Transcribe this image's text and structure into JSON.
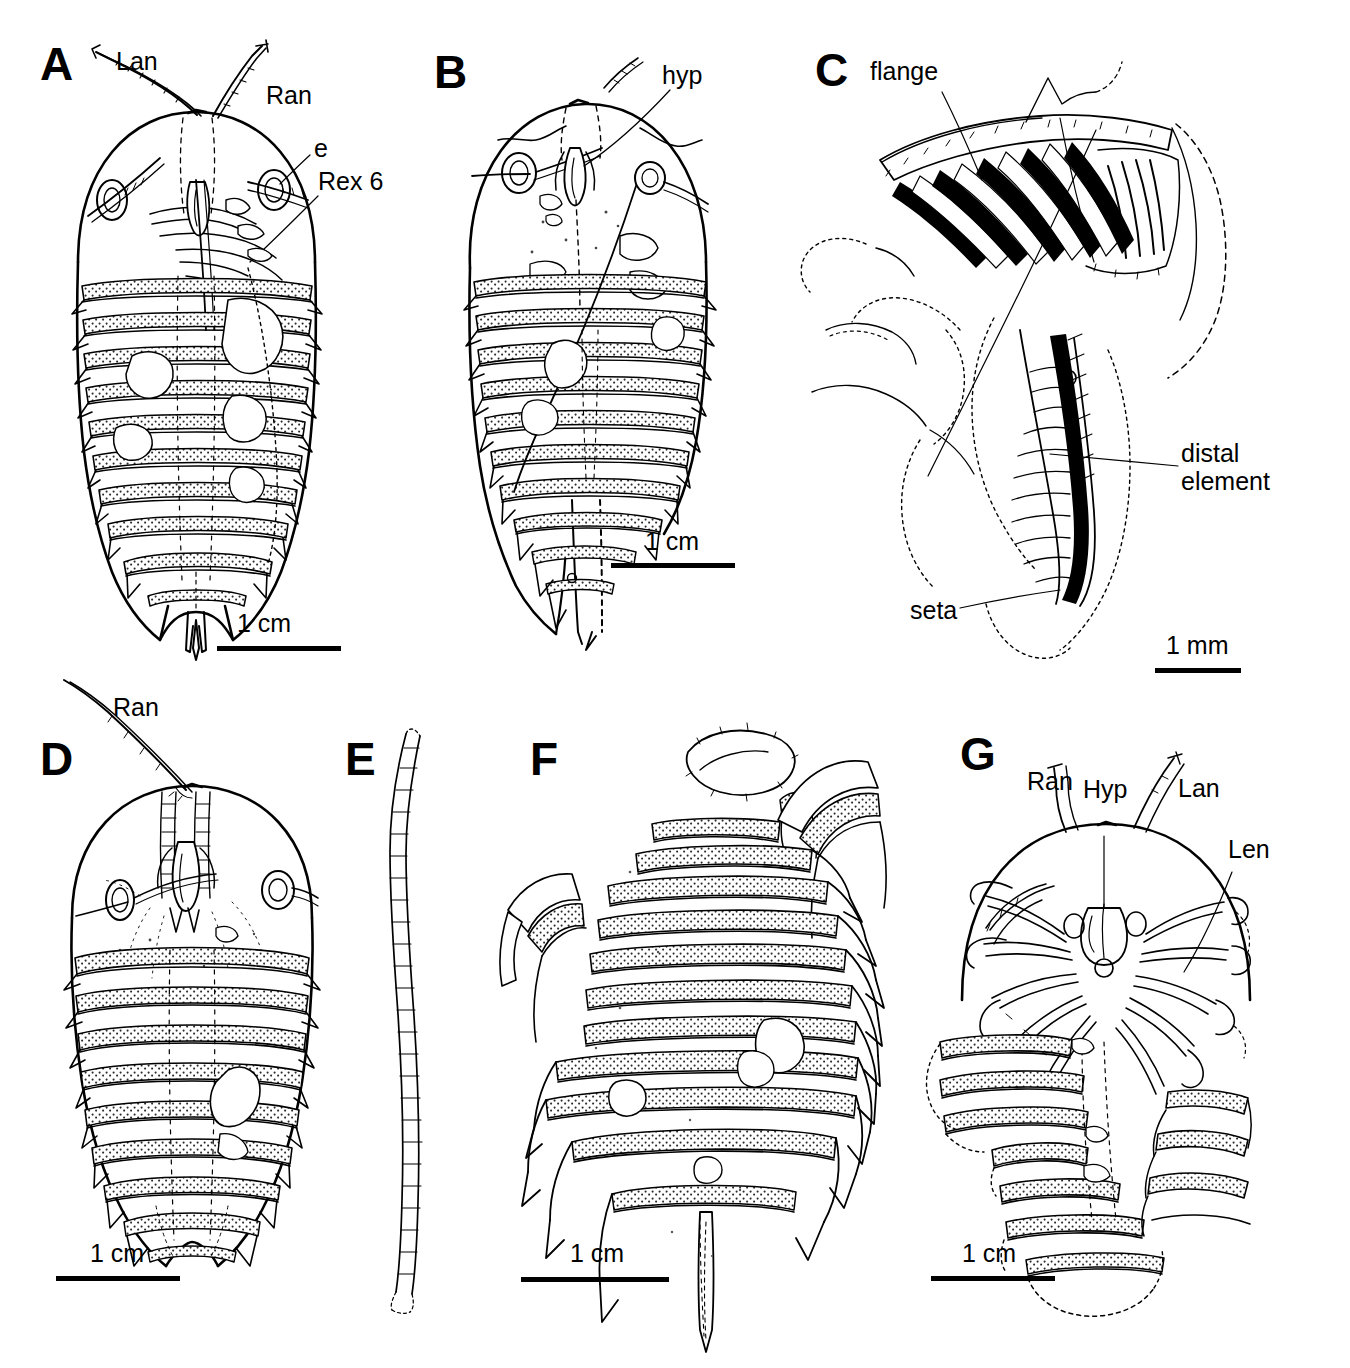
{
  "figure": {
    "background": "#ffffff",
    "ink": "#000000",
    "panel_count": 7
  },
  "panels": [
    {
      "id": "A",
      "letter": "A",
      "subject": "complete dorsal exoskeleton with antennae",
      "scale": {
        "label": "1 cm"
      },
      "annotations": [
        {
          "name": "lan",
          "text": "Lan"
        },
        {
          "name": "ran",
          "text": "Ran"
        },
        {
          "name": "e",
          "text": "e"
        },
        {
          "name": "rex6",
          "text": "Rex 6"
        }
      ]
    },
    {
      "id": "B",
      "letter": "B",
      "subject": "cephalon and thorax with hypostome",
      "scale": {
        "label": "1 cm"
      },
      "annotations": [
        {
          "name": "hyp",
          "text": "hyp"
        }
      ]
    },
    {
      "id": "C",
      "letter": "C",
      "subject": "appendage detail with setae",
      "scale": {
        "label": "1 mm"
      },
      "annotations": [
        {
          "name": "flange",
          "text": "flange"
        },
        {
          "name": "distal-element",
          "text": "distal\nelement"
        },
        {
          "name": "seta",
          "text": "seta"
        }
      ]
    },
    {
      "id": "D",
      "letter": "D",
      "subject": "cephalon and thorax with right antenna",
      "scale": {
        "label": "1 cm"
      },
      "annotations": [
        {
          "name": "ran",
          "text": "Ran"
        }
      ]
    },
    {
      "id": "E",
      "letter": "E",
      "subject": "isolated segmented antenna",
      "scale": null,
      "annotations": []
    },
    {
      "id": "F",
      "letter": "F",
      "subject": "thorax and pygidium with spines",
      "scale": {
        "label": "1 cm"
      },
      "annotations": []
    },
    {
      "id": "G",
      "letter": "G",
      "subject": "cephalon with appendages, ventral",
      "scale": {
        "label": "1 cm"
      },
      "annotations": [
        {
          "name": "ran",
          "text": "Ran"
        },
        {
          "name": "hyp",
          "text": "Hyp"
        },
        {
          "name": "lan",
          "text": "Lan"
        },
        {
          "name": "len",
          "text": "Len"
        }
      ]
    }
  ],
  "text": {
    "a_letter": "A",
    "a_lan": "Lan",
    "a_ran": "Ran",
    "a_e": "e",
    "a_rex6": "Rex 6",
    "a_scale": "1 cm",
    "b_letter": "B",
    "b_hyp": "hyp",
    "b_scale": "1 cm",
    "c_letter": "C",
    "c_flange": "flange",
    "c_distal": "distal",
    "c_element": "element",
    "c_seta": "seta",
    "c_scale": "1 mm",
    "d_letter": "D",
    "d_ran": "Ran",
    "d_scale": "1 cm",
    "e_letter": "E",
    "f_letter": "F",
    "f_scale": "1 cm",
    "g_letter": "G",
    "g_ran": "Ran",
    "g_hyp": "Hyp",
    "g_lan": "Lan",
    "g_len": "Len",
    "g_scale": "1 cm"
  }
}
